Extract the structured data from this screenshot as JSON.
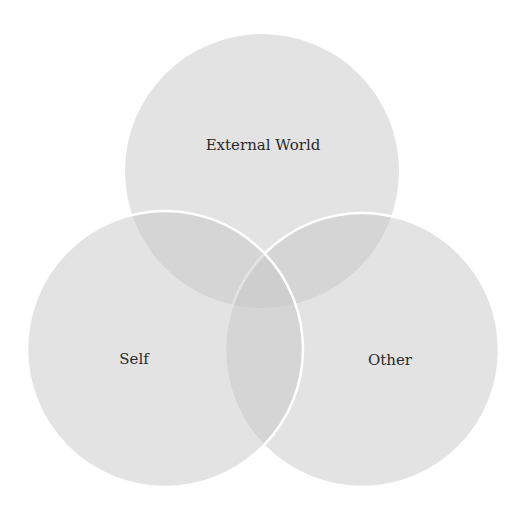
{
  "diagram": {
    "type": "venn",
    "title": "",
    "sets": [
      {
        "id": "external-world",
        "label": "External World",
        "cx": 262,
        "cy": 171,
        "r": 137,
        "label_x": 263,
        "label_y": 150
      },
      {
        "id": "self",
        "label": "Self",
        "cx": 165,
        "cy": 349,
        "r": 138,
        "label_x": 134,
        "label_y": 364
      },
      {
        "id": "other",
        "label": "Other",
        "cx": 362,
        "cy": 350,
        "r": 137,
        "label_x": 390,
        "label_y": 365
      }
    ],
    "colors": {
      "background": "#ffffff",
      "circle_fill": "#c8c8c8",
      "circle_fill_opacity": 0.5,
      "outline": "#ffffff",
      "text": "#2a2a2a"
    }
  }
}
